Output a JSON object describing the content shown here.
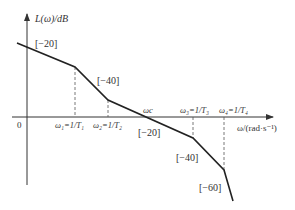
{
  "axes": {
    "y_label": "L(ω)/dB",
    "x_label": "ω/(rad·s⁻¹)",
    "origin_label": "0"
  },
  "frequencies": [
    {
      "id": "w1",
      "label": "ω₁=1/T₁"
    },
    {
      "id": "w2",
      "label": "ω₂=1/T₂"
    },
    {
      "id": "wc",
      "label": "ωc"
    },
    {
      "id": "w3",
      "label": "ω₃=1/T₃"
    },
    {
      "id": "w4",
      "label": "ω₄=1/T₄"
    }
  ],
  "slopes": [
    {
      "segment": 1,
      "label": "[−20]",
      "db_per_decade": -20
    },
    {
      "segment": 2,
      "label": "[−40]",
      "db_per_decade": -40
    },
    {
      "segment": 3,
      "label": "[−20]",
      "db_per_decade": -20
    },
    {
      "segment": 4,
      "label": "[−40]",
      "db_per_decade": -40
    },
    {
      "segment": 5,
      "label": "[−60]",
      "db_per_decade": -60
    }
  ],
  "colors": {
    "line": "#222222",
    "axis": "#333333",
    "dashed": "#555555"
  }
}
